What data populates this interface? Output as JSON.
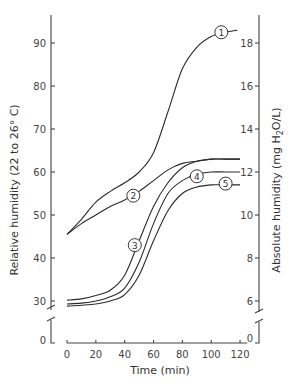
{
  "chart_data": {
    "type": "line",
    "title": "",
    "xlabel": "Time (min)",
    "ylabel": "Relative humidity (22 to 26° C)",
    "y2label": "Absolute humidity (mg H2O/L)",
    "xlim": [
      0,
      125
    ],
    "ylim": [
      0,
      95
    ],
    "y2lim": [
      0,
      19
    ],
    "axis_break": true,
    "grid": false,
    "legend_position": "inline numbered circle labels",
    "x_ticks": [
      0,
      20,
      40,
      60,
      80,
      100,
      120
    ],
    "y_ticks": [
      0,
      30,
      40,
      50,
      60,
      70,
      80,
      90
    ],
    "y2_ticks": [
      0,
      6,
      8,
      10,
      12,
      14,
      16,
      18
    ],
    "series": [
      {
        "name": "1",
        "x": [
          0,
          10,
          20,
          30,
          40,
          50,
          60,
          70,
          80,
          90,
          100,
          110,
          118
        ],
        "values": [
          45.5,
          49,
          53,
          55.5,
          57.5,
          60,
          64.5,
          74,
          84,
          89,
          91.5,
          92.5,
          93
        ],
        "label_at": [
          107,
          92.5
        ]
      },
      {
        "name": "2",
        "x": [
          0,
          10,
          20,
          30,
          40,
          50,
          60,
          70,
          80,
          90,
          100,
          110,
          120
        ],
        "values": [
          45.5,
          48,
          50,
          52,
          53.5,
          55.5,
          58,
          60.5,
          62,
          62.5,
          63,
          63,
          63
        ],
        "label_at": [
          46,
          54.5
        ]
      },
      {
        "name": "3",
        "x": [
          0,
          10,
          20,
          30,
          40,
          50,
          60,
          70,
          80,
          90,
          100,
          110,
          120
        ],
        "values": [
          30.2,
          30.5,
          31.3,
          32.5,
          36,
          44,
          52,
          57.5,
          61,
          62.5,
          63,
          63,
          63
        ],
        "label_at": [
          47,
          43
        ]
      },
      {
        "name": "4",
        "x": [
          0,
          10,
          20,
          30,
          40,
          50,
          60,
          70,
          80,
          90,
          100,
          110,
          120
        ],
        "values": [
          29.3,
          29.5,
          30,
          31,
          33,
          39,
          48,
          55,
          58,
          59.5,
          60,
          60,
          60
        ],
        "label_at": [
          90,
          59
        ]
      },
      {
        "name": "5",
        "x": [
          0,
          10,
          20,
          30,
          40,
          50,
          60,
          70,
          80,
          90,
          100,
          110,
          120
        ],
        "values": [
          28.8,
          29,
          29.3,
          30,
          31.5,
          36,
          44,
          51,
          55,
          56.5,
          57,
          57,
          57
        ],
        "label_at": [
          110,
          57.3
        ]
      }
    ]
  },
  "labels": {
    "x_axis_title": "Time (min)",
    "y_left_title": "Relative humidity (22 to 26° C)",
    "y_right_title_pre": "Absolute humidity (mg H",
    "y_right_title_sub": "2",
    "y_right_title_post": "O/L)"
  }
}
